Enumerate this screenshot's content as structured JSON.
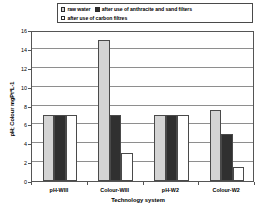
{
  "chart_data": {
    "type": "bar",
    "title": "",
    "xlabel": "Technology system",
    "ylabel": "pH; Colour mgPt*L-1",
    "categories": [
      "pH-WIII",
      "Colour-WIII",
      "pH-W2",
      "Colour-W2"
    ],
    "series": [
      {
        "name": "raw water",
        "color": "#d4d4d4",
        "values": [
          7.0,
          14.9,
          7.0,
          7.5
        ]
      },
      {
        "name": "after use of anthracite and sand filters",
        "color": "#303030",
        "values": [
          7.0,
          7.0,
          7.0,
          5.0
        ]
      },
      {
        "name": "after use of carbon filtres",
        "color": "#ffffff",
        "values": [
          7.0,
          3.0,
          7.0,
          1.5
        ]
      }
    ],
    "ylim": [
      0,
      16
    ],
    "yticks": [
      0,
      2,
      4,
      6,
      8,
      10,
      12,
      14,
      16
    ],
    "ytick_labels": [
      "0",
      "2",
      "4",
      "6",
      "8",
      "10",
      "12",
      "14",
      "16"
    ],
    "grid": true,
    "legend_position": "top"
  },
  "legend": {
    "entries": [
      {
        "label": "raw water",
        "swatch": "raw-water-swatch"
      },
      {
        "label": "after use of anthracite and sand filters",
        "swatch": "anthracite-sand-swatch"
      },
      {
        "label": "after use of carbon filtres",
        "swatch": "carbon-filtres-swatch"
      }
    ]
  },
  "axes": {
    "y_title": "pH; Colour mgPt*L-1",
    "x_title": "Technology system"
  }
}
